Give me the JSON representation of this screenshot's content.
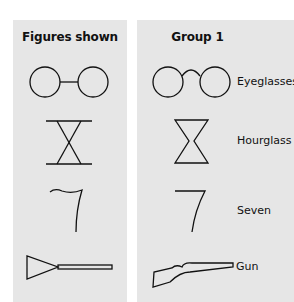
{
  "panels": {
    "shown": {
      "title": "Figures shown"
    },
    "group1": {
      "title": "Group 1"
    }
  },
  "figures": [
    {
      "shown": "two circles joined by straight line",
      "label": "Eyeglasses"
    },
    {
      "shown": "two triangles point-to-point between bars",
      "label": "Hourglass"
    },
    {
      "shown": "curved seven shape",
      "label": "Seven"
    },
    {
      "shown": "triangle with rectangle bar",
      "label": "Gun"
    }
  ],
  "colors": {
    "panel": "#e6e6e6",
    "stroke": "#111111"
  }
}
